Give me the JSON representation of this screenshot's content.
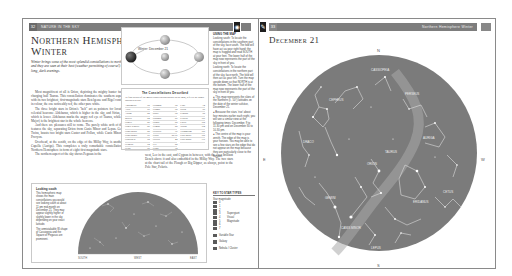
{
  "left_page": {
    "page_number": "32",
    "running_head": "Nature in the Sky",
    "title": "Northern Hemisphere Winter",
    "intro": "Winter brings some of the most splendid constellations to northern skies, and they are seen at their best (weather permitting of course!) during the long, dark evenings.",
    "body_col_a": [
      "Most magnificent of all is Orion, depicting the mighty hunter facing up to the charging bull Taurus. This constellation dominates the southern aspect of the sky, with its two brightest, first-magnitude stars Betelgeuse and Rigel contrasting starkly in colour, the one noticeably red, the other pure white.",
      "The three bright stars in Orion's \"belt\" act as pointers for locating two other celestial beacons: Aldebaran, which is higher in the sky, and Sirius, the Dog Star, which is lower. Aldebaran marks the angry red eye of Taurus, while Sirius (Canis Major) is the brightest star in the whole heavens.",
      "And there are pleasures still to come. The purely white arch of the Milky Way features the sky, separating Orion from Canis Minor and Lepus. Gemini, with its Twins, boasts two bright stars Castor and Pollux, while Canis Minor has just one, Procyon.",
      "Overhead, at the zenith, on the edge of the Milky Way, is another beacon star Capella (Auriga). This completes a truly remarkable constellation. As for the Northern Hemisphere in form of eight first magnitude stars.",
      "The northern aspect of the sky shows Pegasus in the"
    ],
    "body_col_b": [
      "west, Leo in the east, and Cygnus in between, with the even brilliant Deneb above it and also embedded in the Milky Way. The two stars at the chart tail of the Plough or Big Dipper, as always, point to the Pole Star, Polaris."
    ],
    "orbit_diagram": {
      "label": "Winter: December 21",
      "positions": [
        "top",
        "left-earth",
        "right",
        "bottom",
        "sun-center"
      ]
    },
    "constellation_box": {
      "title": "The Constellations Described",
      "subtitle": "To find details of the major constellations shown on the map, refer to the pages indicated below.",
      "entries": [
        {
          "name": "Andromeda",
          "page": "98"
        },
        {
          "name": "Aries",
          "page": "99"
        },
        {
          "name": "Auriga",
          "page": "82"
        },
        {
          "name": "Boötes",
          "page": "84"
        },
        {
          "name": "Cancer",
          "page": "86"
        },
        {
          "name": "Canes Venatici",
          "page": "86"
        },
        {
          "name": "Canis Major",
          "page": "88"
        },
        {
          "name": "Canis Minor",
          "page": "90"
        },
        {
          "name": "Cassiopeia",
          "page": "92"
        },
        {
          "name": "Cepheus",
          "page": "94"
        },
        {
          "name": "Cetus",
          "page": "96"
        },
        {
          "name": "Columba",
          "page": "98"
        },
        {
          "name": "Cygnus",
          "page": "98"
        },
        {
          "name": "Draco",
          "page": "98"
        },
        {
          "name": "Eridanus",
          "page": "60"
        },
        {
          "name": "Fornax",
          "page": "68"
        },
        {
          "name": "Gemini",
          "page": "88"
        },
        {
          "name": "Hercules",
          "page": "76"
        },
        {
          "name": "Hydra",
          "page": "86-90"
        },
        {
          "name": "Lacerta",
          "page": "44"
        },
        {
          "name": "Leo",
          "page": "82"
        },
        {
          "name": "Lepus",
          "page": "72"
        },
        {
          "name": "Lynx",
          "page": "74"
        },
        {
          "name": "Orion",
          "page": "96"
        },
        {
          "name": "Pegasus",
          "page": "98"
        },
        {
          "name": "Perseus",
          "page": "100"
        },
        {
          "name": "Pisces",
          "page": "102"
        },
        {
          "name": "Taurus",
          "page": "104"
        },
        {
          "name": "Triangulum",
          "page": "106"
        },
        {
          "name": "Ursa Major",
          "page": "108"
        },
        {
          "name": "Ursa Minor",
          "page": "110"
        }
      ]
    },
    "sidebar": {
      "heading": "Using the map",
      "paragraphs": [
        "Looking south: To locate the constellations in the southern part of the sky, face south. The fold will have act as your right hand: the map is hugged and read SOUTH at your feet. The lower half of the map now represents the part of the sky in front of you.",
        "Looking north: To locate the constellations in the northern part of the sky, face north. The fold will then act as your left. Turn the map upside down so that NORTH is at the bottom. The lower half of the map now represents the part of the sky in front of you.",
        "● This map represents the skies of the Northern (c. 50°) latitudes on the date of the winter solstice, December 21.",
        "● Because the stars 'rise' about four minutes earlier each night, you will see a similar view at the following times: December, 9 to 11.30 pm and on December 30 to 10.30 pm.",
        "● The centre of the map is your zenith. The edge of the map is your horizon. You may be able to see a few stars on the edge that do not appear on the map because they are particularly close to the horizon."
      ]
    },
    "key": {
      "heading": "Key to star types",
      "subheading": "Star magnitude",
      "magnitudes": [
        {
          "mag": "0",
          "label": ""
        },
        {
          "mag": "1",
          "label": ""
        },
        {
          "mag": "2",
          "label": ""
        },
        {
          "mag": "3",
          "label": "Supergiant"
        },
        {
          "mag": "4",
          "label": "Visual"
        },
        {
          "mag": "5",
          "label": "Magnitude"
        },
        {
          "mag": "6",
          "label": ""
        },
        {
          "mag": "7",
          "label": ""
        }
      ],
      "extras": [
        "Variable Star",
        "Galaxy",
        "Nebula / Cluster"
      ]
    },
    "horizon_panel": {
      "heading": "Looking south",
      "paragraphs": [
        "This hemispheric map shows the main constellations you would see looking south at about 11 pm mid-month on December 21. They may appear slightly higher or slightly lower in the sky depending on your exact latitude.",
        "The unmistakable W-shape of Cassiopeia and the Square of Pegasus are prominent."
      ],
      "horizon_labels": [
        "SOUTH",
        "WEST",
        "EAST"
      ]
    }
  },
  "right_page": {
    "page_number": "33",
    "running_head": "Northern Hemisphere Winter",
    "title": "December 21",
    "compass": {
      "north": "N",
      "south": "S",
      "east": "E",
      "west": "W"
    },
    "chart_colors": {
      "sky": "#7b7b7b",
      "lines": "#d8d8d8",
      "stars": "#ffffff"
    }
  }
}
